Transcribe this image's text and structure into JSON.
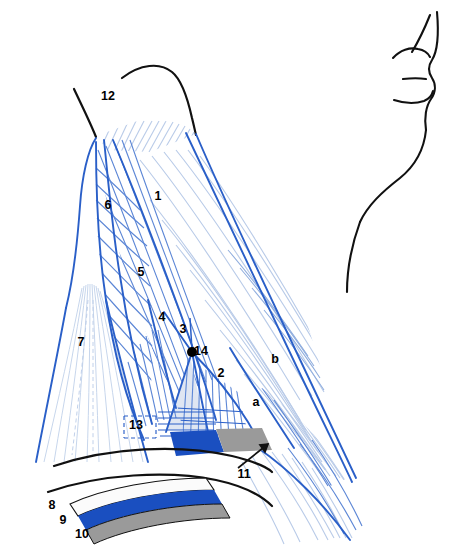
{
  "figure": {
    "background_color": "#ffffff",
    "width": 459,
    "height": 559
  },
  "colors": {
    "outline_blue": "#2a5fc8",
    "striation_blue": "#5d87d6",
    "striation_pale": "#b9cbe8",
    "band_blue": "#1a4fc0",
    "band_gray": "#9a9a9a",
    "band_white": "#fbfbfb",
    "shade_pale": "#dfe6f2",
    "contour_black": "#111111",
    "label_black": "#000000"
  },
  "labels": [
    {
      "id": "label-1",
      "text": "1",
      "x": 158,
      "y": 197
    },
    {
      "id": "label-2",
      "text": "2",
      "x": 221,
      "y": 374
    },
    {
      "id": "label-3",
      "text": "3",
      "x": 183,
      "y": 330
    },
    {
      "id": "label-4",
      "text": "4",
      "x": 162,
      "y": 318
    },
    {
      "id": "label-5",
      "text": "5",
      "x": 141,
      "y": 273
    },
    {
      "id": "label-6",
      "text": "6",
      "x": 108,
      "y": 206
    },
    {
      "id": "label-7",
      "text": "7",
      "x": 81,
      "y": 343
    },
    {
      "id": "label-8",
      "text": "8",
      "x": 52,
      "y": 506
    },
    {
      "id": "label-9",
      "text": "9",
      "x": 63,
      "y": 521
    },
    {
      "id": "label-10",
      "text": "10",
      "x": 82,
      "y": 535
    },
    {
      "id": "label-11",
      "text": "11",
      "x": 244,
      "y": 475
    },
    {
      "id": "label-12",
      "text": "12",
      "x": 108,
      "y": 97
    },
    {
      "id": "label-13",
      "text": "13",
      "x": 136,
      "y": 426
    },
    {
      "id": "label-14",
      "text": "14",
      "x": 201,
      "y": 352
    }
  ],
  "letter_labels": [
    {
      "id": "label-a",
      "text": "a",
      "x": 256,
      "y": 403
    },
    {
      "id": "label-b",
      "text": "b",
      "x": 275,
      "y": 360
    }
  ],
  "markers": {
    "point_14": {
      "x": 192,
      "y": 352,
      "r": 5,
      "color": "#000000"
    }
  },
  "leaders": {
    "label_11": {
      "from_x": 238,
      "from_y": 468,
      "to_x": 268,
      "to_y": 444
    }
  },
  "bands": [
    {
      "name": "band-white-8",
      "color": "#fbfbfb",
      "label_ref": "8"
    },
    {
      "name": "band-blue-9",
      "color": "#1a4fc0",
      "label_ref": "9"
    },
    {
      "name": "band-gray-10",
      "color": "#9a9a9a",
      "label_ref": "10"
    }
  ],
  "regions": [
    {
      "name": "region-1",
      "label_ref": "1"
    },
    {
      "name": "region-2",
      "label_ref": "2"
    },
    {
      "name": "region-3",
      "label_ref": "3"
    },
    {
      "name": "region-4",
      "label_ref": "4"
    },
    {
      "name": "region-5",
      "label_ref": "5"
    },
    {
      "name": "region-6",
      "label_ref": "6"
    },
    {
      "name": "region-7",
      "label_ref": "7"
    },
    {
      "name": "region-12",
      "label_ref": "12"
    },
    {
      "name": "region-13",
      "label_ref": "13"
    }
  ]
}
